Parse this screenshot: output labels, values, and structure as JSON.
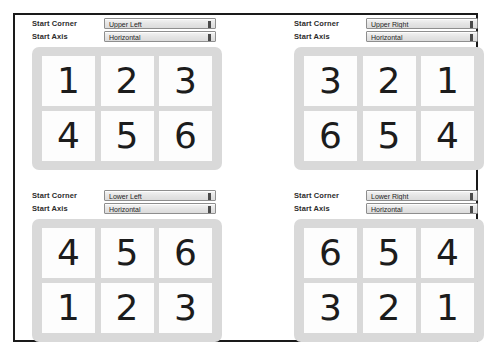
{
  "labels": {
    "start_corner": "Start Corner",
    "start_axis": "Start Axis"
  },
  "icons": {
    "dropdown_arrow": "chevron-updown-icon"
  },
  "colors": {
    "frame_border": "#1a1a1a",
    "card_background": "#d9d9d9",
    "cell_background": "#fdfdfd",
    "page_background": "#ffffff",
    "text": "#1c1c1c"
  },
  "panels": [
    {
      "id": "upper-left",
      "start_corner": "Upper Left",
      "start_axis": "Horizontal",
      "grid": [
        [
          "1",
          "2",
          "3"
        ],
        [
          "4",
          "5",
          "6"
        ]
      ]
    },
    {
      "id": "upper-right",
      "start_corner": "Upper Right",
      "start_axis": "Horizontal",
      "grid": [
        [
          "3",
          "2",
          "1"
        ],
        [
          "6",
          "5",
          "4"
        ]
      ]
    },
    {
      "id": "lower-left",
      "start_corner": "Lower Left",
      "start_axis": "Horizontal",
      "grid": [
        [
          "4",
          "5",
          "6"
        ],
        [
          "1",
          "2",
          "3"
        ]
      ]
    },
    {
      "id": "lower-right",
      "start_corner": "Lower Right",
      "start_axis": "Horizontal",
      "grid": [
        [
          "6",
          "5",
          "4"
        ],
        [
          "3",
          "2",
          "1"
        ]
      ]
    }
  ]
}
